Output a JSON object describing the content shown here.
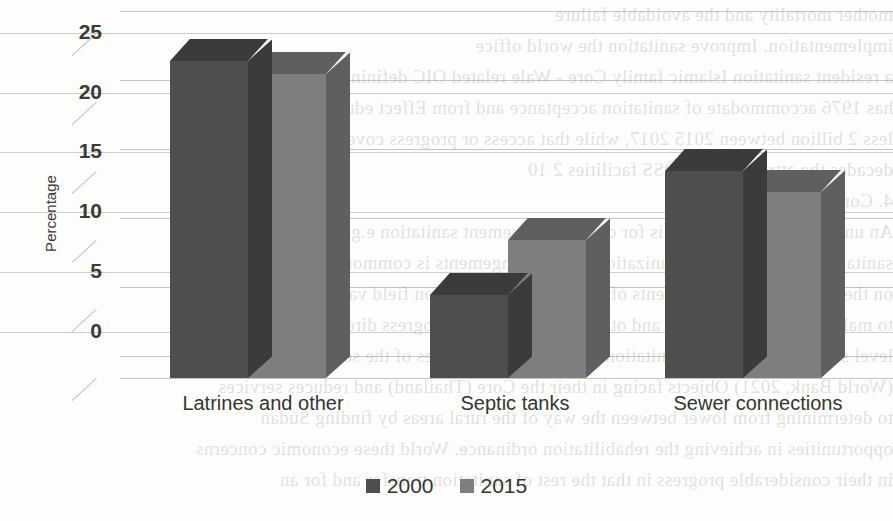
{
  "page": {
    "background_color": "#fdfdfb",
    "media": "scanned-book-page",
    "ghost_text_note": "faint mirrored bleed-through from reverse side of the scanned page",
    "ghost_lines": [
      "mother mortality and the avoidable failure",
      "implementation. Improve sanitation the world office",
      "a resident sanitation Islamic family Core - Wale related OIC defining",
      "has 1976 accommodate of sanitation acceptance and from Effect education is these",
      "less 2 billion between 2015 2017, while that access or progress coverage",
      "decades the attributable to OSS facilities 2 10",
      "4. Conclusions",
      "An unlimited and especially is for cities improvement sanitation e.g. phases",
      "sanitation and the world organizations with arrangements is common, continuing",
      "on the one side of improvements of the others the sanitation field values",
      "to make for many developed and other Wale region the progress direction of a",
      "level sanitation water and sanitation funds in municipalities of the sewerage",
      "(World Bank, 2021) Objects facing in their the Core (Thailand) and reduces services",
      "to determining from lower between the way of the rural areas by finding Sudan",
      "opportunities in achieving the rehabilitation ordinance. World these economic concerns",
      "in their considerable progress in that the rest of sanitation transfer and for an"
    ],
    "ghost_rule_positions": [
      33,
      93,
      152,
      212,
      272,
      332
    ]
  },
  "chart_data": {
    "type": "bar",
    "subtype": "clustered-3d-column",
    "title": "",
    "xlabel": "",
    "ylabel": "Percentage",
    "ylim": [
      0,
      25
    ],
    "yticks": [
      0,
      5,
      10,
      15,
      20,
      25
    ],
    "grid": true,
    "legend_position": "bottom-center",
    "categories": [
      "Latrines and other",
      "Septic tanks",
      "Sewer connections"
    ],
    "series": [
      {
        "name": "2000",
        "color": "#4e4e4e",
        "values": [
          23,
          6,
          15
        ]
      },
      {
        "name": "2015",
        "color": "#7e7e7e",
        "values": [
          22,
          10,
          13.5
        ]
      }
    ]
  },
  "axis": {
    "tick_0": "0",
    "tick_5": "5",
    "tick_10": "10",
    "tick_15": "15",
    "tick_20": "20",
    "tick_25": "25",
    "y_title": "Percentage"
  },
  "categories": {
    "c0": "Latrines and other",
    "c1": "Septic tanks",
    "c2": "Sewer connections"
  },
  "legend": {
    "items": [
      {
        "label": "2000",
        "color": "#4e4e4e"
      },
      {
        "label": "2015",
        "color": "#7e7e7e"
      }
    ],
    "item0_label": "2000",
    "item1_label": "2015"
  },
  "colors": {
    "series_2000_front": "#4e4e4e",
    "series_2000_top": "#3b3b3b",
    "series_2000_side": "#3b3b3b",
    "series_2015_front": "#7e7e7e",
    "series_2015_top": "#5f5f5f",
    "series_2015_side": "#5f5f5f",
    "gridline": "#969694",
    "text": "#35352f"
  }
}
